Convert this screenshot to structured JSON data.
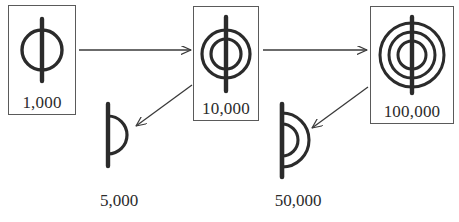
{
  "diagram": {
    "stroke_color": "#2b2b2b",
    "box_border_color": "#5a5a5a",
    "background_color": "#ffffff",
    "boxed_numerals": [
      {
        "label": "1,000",
        "glyph_name": "bar-with-1-circle",
        "rings": 1,
        "x": 8,
        "y": 5,
        "w": 68,
        "h": 110
      },
      {
        "label": "10,000",
        "glyph_name": "bar-with-2-circles",
        "rings": 2,
        "x": 193,
        "y": 6,
        "w": 66,
        "h": 115
      },
      {
        "label": "100,000",
        "glyph_name": "bar-with-3-circles",
        "rings": 3,
        "x": 370,
        "y": 6,
        "w": 84,
        "h": 118
      }
    ],
    "half_numerals": [
      {
        "label": "5,000",
        "glyph_name": "bar-with-1-semicircle",
        "arcs": 1,
        "x": 100,
        "y": 100,
        "label_x": 84,
        "label_y": 192
      },
      {
        "label": "50,000",
        "glyph_name": "bar-with-2-semicircles",
        "arcs": 2,
        "x": 274,
        "y": 101,
        "label_x": 256,
        "label_y": 192
      }
    ],
    "arrows": [
      {
        "name": "arrow-1000-to-10000",
        "kind": "horizontal",
        "from_label": "1,000",
        "to_label": "10,000",
        "x1": 79,
        "y1": 50,
        "x2": 191,
        "y2": 50
      },
      {
        "name": "arrow-10000-to-100000",
        "kind": "horizontal",
        "from_label": "10,000",
        "to_label": "100,000",
        "x1": 263,
        "y1": 50,
        "x2": 367,
        "y2": 50
      },
      {
        "name": "arrow-10000-to-5000",
        "kind": "diagonal",
        "from_label": "10,000",
        "to_label": "5,000",
        "x1": 192,
        "y1": 85,
        "x2": 134,
        "y2": 127
      },
      {
        "name": "arrow-100000-to-50000",
        "kind": "diagonal",
        "from_label": "100,000",
        "to_label": "50,000",
        "x1": 368,
        "y1": 87,
        "x2": 310,
        "y2": 129
      }
    ]
  }
}
